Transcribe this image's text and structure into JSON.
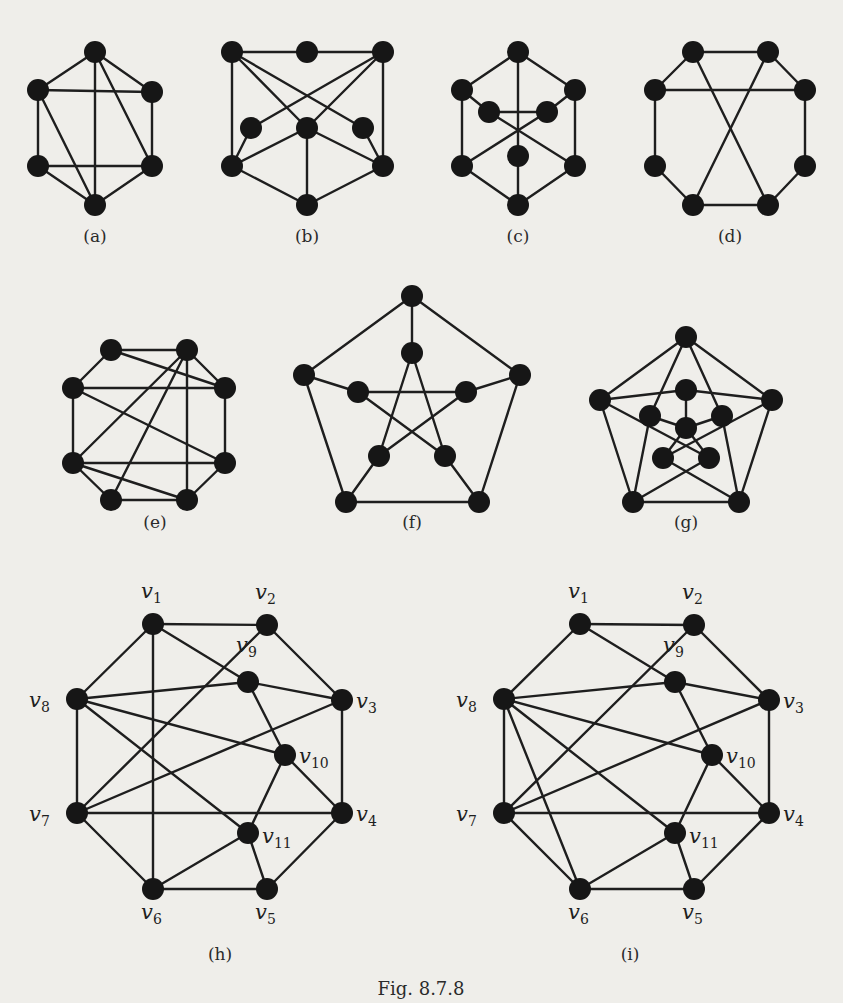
{
  "figure": {
    "caption": "Fig. 8.7.8",
    "node_color": "#161616",
    "edge_color": "#1e1e1e",
    "background": "#efeeea"
  },
  "graphs": [
    {
      "id": "a",
      "label": "(a)",
      "label_pos": [
        95,
        242
      ],
      "nodes": [
        [
          95,
          52
        ],
        [
          38,
          90
        ],
        [
          152,
          92
        ],
        [
          38,
          166
        ],
        [
          152,
          166
        ],
        [
          95,
          205
        ]
      ],
      "edges": [
        [
          0,
          1
        ],
        [
          0,
          2
        ],
        [
          0,
          5
        ],
        [
          0,
          4
        ],
        [
          1,
          2
        ],
        [
          1,
          3
        ],
        [
          1,
          5
        ],
        [
          2,
          4
        ],
        [
          3,
          4
        ],
        [
          3,
          5
        ],
        [
          4,
          5
        ]
      ]
    },
    {
      "id": "b",
      "label": "(b)",
      "label_pos": [
        307,
        242
      ],
      "nodes": [
        [
          232,
          52
        ],
        [
          307,
          52
        ],
        [
          383,
          52
        ],
        [
          251,
          128
        ],
        [
          307,
          128
        ],
        [
          363,
          128
        ],
        [
          232,
          166
        ],
        [
          383,
          166
        ],
        [
          307,
          205
        ]
      ],
      "edges": [
        [
          0,
          1
        ],
        [
          1,
          2
        ],
        [
          0,
          6
        ],
        [
          2,
          7
        ],
        [
          0,
          4
        ],
        [
          0,
          5
        ],
        [
          2,
          3
        ],
        [
          2,
          4
        ],
        [
          3,
          6
        ],
        [
          5,
          7
        ],
        [
          4,
          6
        ],
        [
          4,
          7
        ],
        [
          4,
          8
        ],
        [
          6,
          8
        ],
        [
          7,
          8
        ]
      ]
    },
    {
      "id": "c",
      "label": "(c)",
      "label_pos": [
        518,
        242
      ],
      "nodes": [
        [
          518,
          52
        ],
        [
          462,
          90
        ],
        [
          575,
          90
        ],
        [
          489,
          112
        ],
        [
          547,
          112
        ],
        [
          518,
          156
        ],
        [
          462,
          166
        ],
        [
          575,
          166
        ],
        [
          518,
          205
        ]
      ],
      "edges": [
        [
          0,
          1
        ],
        [
          0,
          2
        ],
        [
          0,
          5
        ],
        [
          1,
          6
        ],
        [
          2,
          7
        ],
        [
          1,
          3
        ],
        [
          2,
          4
        ],
        [
          3,
          4
        ],
        [
          3,
          7
        ],
        [
          4,
          6
        ],
        [
          5,
          8
        ],
        [
          6,
          8
        ],
        [
          7,
          8
        ]
      ]
    },
    {
      "id": "d",
      "label": "(d)",
      "label_pos": [
        730,
        242
      ],
      "nodes": [
        [
          693,
          52
        ],
        [
          768,
          52
        ],
        [
          655,
          90
        ],
        [
          805,
          90
        ],
        [
          655,
          166
        ],
        [
          805,
          166
        ],
        [
          693,
          205
        ],
        [
          768,
          205
        ]
      ],
      "edges": [
        [
          0,
          1
        ],
        [
          0,
          2
        ],
        [
          1,
          3
        ],
        [
          2,
          3
        ],
        [
          0,
          7
        ],
        [
          1,
          6
        ],
        [
          2,
          4
        ],
        [
          3,
          5
        ],
        [
          4,
          6
        ],
        [
          5,
          7
        ],
        [
          6,
          7
        ]
      ]
    },
    {
      "id": "e",
      "label": "(e)",
      "label_pos": [
        155,
        528
      ],
      "nodes": [
        [
          111,
          350
        ],
        [
          187,
          350
        ],
        [
          73,
          388
        ],
        [
          225,
          388
        ],
        [
          73,
          463
        ],
        [
          225,
          463
        ],
        [
          111,
          500
        ],
        [
          187,
          500
        ]
      ],
      "edges": [
        [
          0,
          1
        ],
        [
          0,
          2
        ],
        [
          0,
          3
        ],
        [
          1,
          3
        ],
        [
          1,
          4
        ],
        [
          1,
          6
        ],
        [
          1,
          7
        ],
        [
          2,
          3
        ],
        [
          2,
          4
        ],
        [
          2,
          5
        ],
        [
          3,
          5
        ],
        [
          4,
          5
        ],
        [
          4,
          6
        ],
        [
          4,
          7
        ],
        [
          5,
          7
        ],
        [
          6,
          7
        ]
      ]
    },
    {
      "id": "f",
      "label": "(f)",
      "label_pos": [
        412,
        528
      ],
      "nodes": [
        [
          412,
          296
        ],
        [
          304,
          375
        ],
        [
          520,
          375
        ],
        [
          346,
          502
        ],
        [
          479,
          502
        ],
        [
          412,
          353
        ],
        [
          358,
          392
        ],
        [
          466,
          392
        ],
        [
          379,
          456
        ],
        [
          445,
          456
        ]
      ],
      "edges": [
        [
          0,
          1
        ],
        [
          0,
          2
        ],
        [
          1,
          3
        ],
        [
          2,
          4
        ],
        [
          3,
          4
        ],
        [
          0,
          5
        ],
        [
          1,
          6
        ],
        [
          2,
          7
        ],
        [
          3,
          8
        ],
        [
          4,
          9
        ],
        [
          5,
          8
        ],
        [
          5,
          9
        ],
        [
          6,
          7
        ],
        [
          6,
          9
        ],
        [
          7,
          8
        ]
      ]
    },
    {
      "id": "g",
      "label": "(g)",
      "label_pos": [
        686,
        528
      ],
      "nodes": [
        [
          686,
          337
        ],
        [
          600,
          400
        ],
        [
          772,
          400
        ],
        [
          633,
          502
        ],
        [
          739,
          502
        ],
        [
          686,
          390
        ],
        [
          650,
          416
        ],
        [
          722,
          416
        ],
        [
          663,
          458
        ],
        [
          709,
          458
        ],
        [
          686,
          428
        ]
      ],
      "edges": [
        [
          0,
          1
        ],
        [
          0,
          2
        ],
        [
          1,
          3
        ],
        [
          2,
          4
        ],
        [
          3,
          4
        ],
        [
          0,
          6
        ],
        [
          0,
          7
        ],
        [
          1,
          5
        ],
        [
          1,
          9
        ],
        [
          2,
          5
        ],
        [
          2,
          8
        ],
        [
          3,
          6
        ],
        [
          3,
          9
        ],
        [
          4,
          7
        ],
        [
          4,
          8
        ],
        [
          5,
          10
        ],
        [
          6,
          10
        ],
        [
          7,
          10
        ],
        [
          8,
          10
        ],
        [
          9,
          10
        ]
      ]
    },
    {
      "id": "h",
      "label": "(h)",
      "label_pos": [
        220,
        960
      ],
      "nodes": [
        [
          153,
          624
        ],
        [
          267,
          625
        ],
        [
          342,
          700
        ],
        [
          342,
          813
        ],
        [
          267,
          889
        ],
        [
          153,
          889
        ],
        [
          77,
          813
        ],
        [
          77,
          699
        ],
        [
          248,
          682
        ],
        [
          285,
          755
        ],
        [
          248,
          833
        ]
      ],
      "vertex_labels": [
        "v1",
        "v2",
        "v3",
        "v4",
        "v5",
        "v6",
        "v7",
        "v8",
        "v9",
        "v10",
        "v11"
      ],
      "label_offsets": [
        [
          -12,
          -26
        ],
        [
          -12,
          -26
        ],
        [
          14,
          8
        ],
        [
          14,
          8
        ],
        [
          -12,
          30
        ],
        [
          -12,
          30
        ],
        [
          -48,
          8
        ],
        [
          -48,
          8
        ],
        [
          -12,
          -30
        ],
        [
          14,
          8
        ],
        [
          14,
          10
        ]
      ],
      "edges": [
        [
          0,
          1
        ],
        [
          1,
          2
        ],
        [
          2,
          3
        ],
        [
          3,
          4
        ],
        [
          4,
          5
        ],
        [
          5,
          6
        ],
        [
          6,
          7
        ],
        [
          7,
          0
        ],
        [
          0,
          5
        ],
        [
          0,
          8
        ],
        [
          1,
          6
        ],
        [
          2,
          6
        ],
        [
          6,
          3
        ],
        [
          7,
          8
        ],
        [
          8,
          2
        ],
        [
          8,
          9
        ],
        [
          7,
          9
        ],
        [
          7,
          10
        ],
        [
          9,
          3
        ],
        [
          9,
          10
        ],
        [
          10,
          5
        ],
        [
          10,
          4
        ]
      ]
    },
    {
      "id": "i",
      "label": "(i)",
      "label_pos": [
        630,
        960
      ],
      "nodes": [
        [
          580,
          624
        ],
        [
          694,
          625
        ],
        [
          769,
          700
        ],
        [
          769,
          813
        ],
        [
          694,
          889
        ],
        [
          580,
          889
        ],
        [
          504,
          813
        ],
        [
          504,
          699
        ],
        [
          675,
          682
        ],
        [
          712,
          755
        ],
        [
          675,
          833
        ]
      ],
      "vertex_labels": [
        "v1",
        "v2",
        "v3",
        "v4",
        "v5",
        "v6",
        "v7",
        "v8",
        "v9",
        "v10",
        "v11"
      ],
      "label_offsets": [
        [
          -12,
          -26
        ],
        [
          -12,
          -26
        ],
        [
          14,
          8
        ],
        [
          14,
          8
        ],
        [
          -12,
          30
        ],
        [
          -12,
          30
        ],
        [
          -48,
          8
        ],
        [
          -48,
          8
        ],
        [
          -12,
          -30
        ],
        [
          14,
          8
        ],
        [
          14,
          10
        ]
      ],
      "edges": [
        [
          0,
          1
        ],
        [
          1,
          2
        ],
        [
          2,
          3
        ],
        [
          3,
          4
        ],
        [
          4,
          5
        ],
        [
          5,
          6
        ],
        [
          6,
          7
        ],
        [
          7,
          0
        ],
        [
          0,
          8
        ],
        [
          1,
          6
        ],
        [
          2,
          6
        ],
        [
          6,
          3
        ],
        [
          7,
          8
        ],
        [
          8,
          2
        ],
        [
          8,
          9
        ],
        [
          7,
          9
        ],
        [
          7,
          10
        ],
        [
          7,
          5
        ],
        [
          9,
          3
        ],
        [
          9,
          10
        ],
        [
          10,
          5
        ],
        [
          10,
          4
        ]
      ]
    }
  ]
}
